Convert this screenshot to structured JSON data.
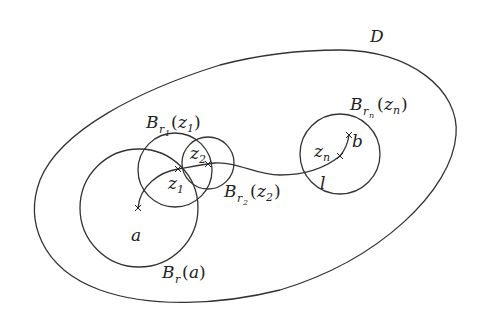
{
  "diagram": {
    "region_label": "D",
    "balls": [
      {
        "name": "B_r(a)",
        "main": "B",
        "sub": "r",
        "subsub": "",
        "arg": "a",
        "argsub": ""
      },
      {
        "name": "B_r1(z1)",
        "main": "B",
        "sub": "r",
        "subsub": "1",
        "arg": "z",
        "argsub": "1"
      },
      {
        "name": "B_r2(z2)",
        "main": "B",
        "sub": "r",
        "subsub": "2",
        "arg": "z",
        "argsub": "2"
      },
      {
        "name": "B_rn(zn)",
        "main": "B",
        "sub": "r",
        "subsub": "n",
        "arg": "z",
        "argsub": "n"
      }
    ],
    "points": [
      {
        "label": "a"
      },
      {
        "label": "b"
      },
      {
        "label": "z",
        "sub": "1"
      },
      {
        "label": "z",
        "sub": "2"
      },
      {
        "label": "z",
        "sub": "n"
      }
    ],
    "curve_label": "l",
    "stroke_color": "#333333",
    "background": "#ffffff"
  }
}
